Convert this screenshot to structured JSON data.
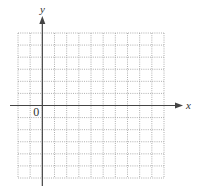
{
  "chart_data": {
    "type": "scatter",
    "title": "",
    "xlabel": "x",
    "ylabel": "y",
    "origin_label": "0",
    "series": [],
    "grid": {
      "on": true,
      "style": "dotted",
      "columns": 12,
      "rows": 12,
      "origin_column_index": 2,
      "origin_row_index": 6
    },
    "xlim": [
      -2,
      10
    ],
    "ylim": [
      -6,
      6
    ],
    "legend": null,
    "annotations": []
  },
  "colors": {
    "grid": "#9a9a9a",
    "axis": "#444444",
    "text": "#333333",
    "background": "#ffffff"
  },
  "layout": {
    "grid_left": 18,
    "grid_top": 33,
    "grid_right": 164,
    "grid_bottom": 178,
    "x_axis_start": 10,
    "x_axis_end": 183,
    "y_axis_top": 16,
    "y_axis_bottom": 186
  }
}
